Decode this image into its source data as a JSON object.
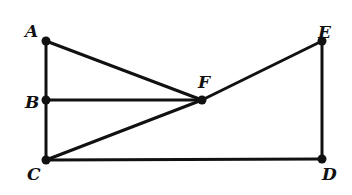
{
  "diagram": {
    "points": [
      {
        "id": "A",
        "x": 46,
        "y": 41,
        "lx": 25,
        "ly": 37
      },
      {
        "id": "B",
        "x": 46,
        "y": 100,
        "lx": 25,
        "ly": 108
      },
      {
        "id": "C",
        "x": 46,
        "y": 160,
        "lx": 27,
        "ly": 180
      },
      {
        "id": "D",
        "x": 322,
        "y": 159,
        "lx": 322,
        "ly": 180
      },
      {
        "id": "E",
        "x": 322,
        "y": 41,
        "lx": 318,
        "ly": 38
      },
      {
        "id": "F",
        "x": 202,
        "y": 100,
        "lx": 198,
        "ly": 88
      }
    ],
    "segments": [
      [
        "A",
        "C"
      ],
      [
        "A",
        "F"
      ],
      [
        "B",
        "F"
      ],
      [
        "C",
        "F"
      ],
      [
        "F",
        "E"
      ],
      [
        "C",
        "D"
      ],
      [
        "E",
        "D"
      ]
    ],
    "stroke": "#111111"
  }
}
